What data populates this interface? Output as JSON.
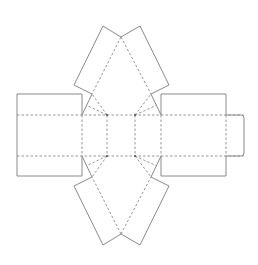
{
  "diagram": {
    "type": "box-net",
    "colors": {
      "cut_line": "#8a8a8a",
      "fold_line": "#8a8a8a",
      "node": "#555555",
      "background": "#ffffff"
    },
    "legend": {
      "solid": "cut line",
      "dashed": "fold line"
    },
    "panels": {
      "left_panel": {
        "x": 17,
        "y": 94,
        "w": 65,
        "h": 82
      },
      "right_panel": {
        "x": 161,
        "y": 94,
        "w": 65,
        "h": 82
      },
      "tab": {
        "x": 226,
        "y": 115,
        "w": 18,
        "h": 41,
        "radius": 3
      }
    },
    "fold_rows": {
      "top_y": 115,
      "bottom_y": 156,
      "x_start": 17,
      "x_end": 244
    },
    "inner_vertices": [
      [
        107,
        115
      ],
      [
        135,
        115
      ],
      [
        107,
        156
      ],
      [
        135,
        156
      ]
    ],
    "top_flaps": {
      "left": [
        [
          103,
          26
        ],
        [
          121,
          37
        ],
        [
          92,
          94
        ],
        [
          74,
          85
        ]
      ],
      "right": [
        [
          140,
          26
        ],
        [
          121,
          37
        ],
        [
          151,
          94
        ],
        [
          169,
          85
        ]
      ]
    },
    "bottom_flaps": {
      "left": [
        [
          103,
          245
        ],
        [
          121,
          234
        ],
        [
          92,
          177
        ],
        [
          74,
          186
        ]
      ],
      "right": [
        [
          140,
          245
        ],
        [
          121,
          234
        ],
        [
          151,
          177
        ],
        [
          169,
          186
        ]
      ]
    }
  }
}
